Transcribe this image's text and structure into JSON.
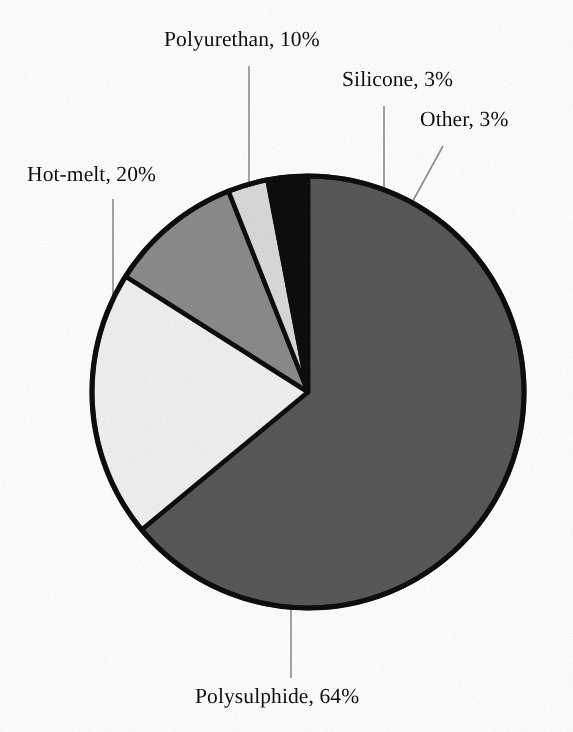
{
  "chart_data": {
    "type": "pie",
    "title": "",
    "subtitle": "",
    "xlabel": "",
    "ylabel": "",
    "legend_position": "none",
    "grid": false,
    "labels_outside": true,
    "label_format": "name, percent",
    "total_percent": 100,
    "start_angle_deg": 0,
    "direction": "clockwise",
    "categories": [
      "Polysulphide",
      "Hot-melt",
      "Polyurethan",
      "Silicone",
      "Other"
    ],
    "values": [
      64,
      20,
      10,
      3,
      3
    ],
    "units": "%",
    "slices": [
      {
        "name": "Polysulphide",
        "value": 64,
        "label": "Polysulphide, 64%",
        "color": "#585858",
        "start_deg": 0,
        "end_deg": 230.4,
        "sweep_deg": 230.4
      },
      {
        "name": "Hot-melt",
        "value": 20,
        "label": "Hot-melt, 20%",
        "color": "#f1f1f1",
        "start_deg": 230.4,
        "end_deg": 302.4,
        "sweep_deg": 72.0
      },
      {
        "name": "Polyurethan",
        "value": 10,
        "label": "Polyurethan, 10%",
        "color": "#8b8b8b",
        "start_deg": 302.4,
        "end_deg": 338.4,
        "sweep_deg": 36.0
      },
      {
        "name": "Silicone",
        "value": 3,
        "label": "Silicone, 3%",
        "color": "#dadada",
        "start_deg": 338.4,
        "end_deg": 349.2,
        "sweep_deg": 10.8
      },
      {
        "name": "Other",
        "value": 3,
        "label": "Other, 3%",
        "color": "#0b0b0b",
        "start_deg": 349.2,
        "end_deg": 360.0,
        "sweep_deg": 10.8
      }
    ],
    "outline_color": "#0d0d0d",
    "background_color": "#ffffff",
    "leader_line_color": "#8e8e8e"
  },
  "labels": {
    "polyurethan": "Polyurethan, 10%",
    "silicone": "Silicone, 3%",
    "other": "Other, 3%",
    "hot_melt": "Hot-melt, 20%",
    "polysulphide": "Polysulphide, 64%"
  }
}
